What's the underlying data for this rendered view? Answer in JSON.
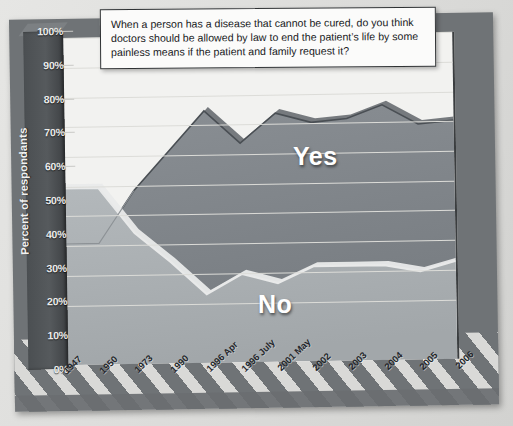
{
  "chart_data": {
    "type": "area",
    "title": "When a person has a disease that cannot be cured, do you think doctors should be allowed by law to end the patient’s life by some painless means if the patient and family request it?",
    "xlabel": "",
    "ylabel": "Percent of respondants",
    "ylim": [
      0,
      100
    ],
    "grid": true,
    "stacked": false,
    "legend_position": "inside-plot-labels",
    "categories": [
      "1947",
      "1950",
      "1973",
      "1990",
      "1996 Apr",
      "1996 July",
      "2001 May",
      "2002",
      "2003",
      "2004",
      "2005",
      "2006"
    ],
    "ytick_labels": [
      "0%",
      "10%",
      "20%",
      "30%",
      "40%",
      "50%",
      "60%",
      "70%",
      "80%",
      "90%",
      "100%"
    ],
    "ytick_values": [
      0,
      10,
      20,
      30,
      40,
      50,
      60,
      70,
      80,
      90,
      100
    ],
    "series": [
      {
        "name": "Yes",
        "color": "#7f8489",
        "values": [
          37,
          37,
          53,
          65,
          77,
          67,
          76,
          73,
          74,
          78,
          72,
          73
        ]
      },
      {
        "name": "No",
        "color": "#a9aeb1",
        "values": [
          54,
          54,
          40,
          31,
          21,
          27,
          24,
          29,
          29,
          29,
          27,
          30
        ]
      }
    ],
    "annotations": [
      {
        "text": "Yes",
        "x": "2001 May",
        "y": 50
      },
      {
        "text": "No",
        "x": "2002",
        "y": 14
      }
    ],
    "colors": {
      "yes_fill": "#7f8489",
      "no_fill": "#a9aeb1",
      "plot_background": "#f2f2f0",
      "frame": "#6f7376",
      "axis_slab": "#4b4f52",
      "gridline": "#dcdcd8",
      "callout_background": "#fbfbfa",
      "callout_border": "#2f3234",
      "text_light": "#ececeb",
      "text_dark": "#17191a"
    }
  }
}
